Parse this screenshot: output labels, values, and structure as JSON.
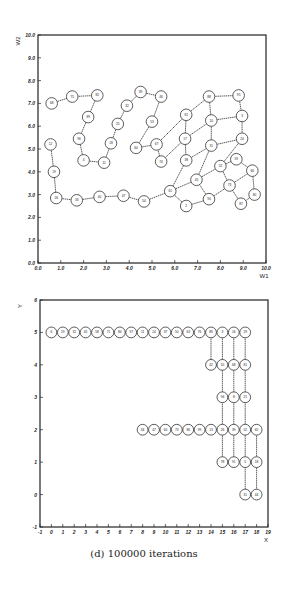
{
  "caption": "(d) 100000 iterations",
  "chart_data": [
    {
      "type": "scatter",
      "title": "",
      "xlabel": "W1",
      "ylabel": "W2",
      "xlim": [
        0,
        10
      ],
      "ylim": [
        0,
        10
      ],
      "xticks": [
        "0.0",
        "1.0",
        "2.0",
        "3.0",
        "4.0",
        "5.0",
        "6.0",
        "7.0",
        "8.0",
        "9.0",
        "10.0"
      ],
      "yticks": [
        "0.0",
        "1.0",
        "2.0",
        "3.0",
        "4.0",
        "5.0",
        "6.0",
        "7.0",
        "8.0",
        "9.0",
        "10.0"
      ],
      "nodes": [
        {
          "id": "a1",
          "x": 0.55,
          "y": 5.2
        },
        {
          "id": "a2",
          "x": 0.7,
          "y": 4.0
        },
        {
          "id": "a3",
          "x": 0.8,
          "y": 2.85
        },
        {
          "id": "a4",
          "x": 1.7,
          "y": 2.75
        },
        {
          "id": "a5",
          "x": 2.7,
          "y": 2.9
        },
        {
          "id": "a6",
          "x": 3.75,
          "y": 2.95
        },
        {
          "id": "a7",
          "x": 4.65,
          "y": 2.7
        },
        {
          "id": "a8",
          "x": 5.8,
          "y": 3.15
        },
        {
          "id": "b1",
          "x": 0.6,
          "y": 7.0
        },
        {
          "id": "b2",
          "x": 1.5,
          "y": 7.3
        },
        {
          "id": "b3",
          "x": 2.6,
          "y": 7.35
        },
        {
          "id": "b4",
          "x": 2.2,
          "y": 6.4
        },
        {
          "id": "b5",
          "x": 1.8,
          "y": 5.45
        },
        {
          "id": "b6",
          "x": 2.0,
          "y": 4.5
        },
        {
          "id": "b7",
          "x": 2.9,
          "y": 4.4
        },
        {
          "id": "b8",
          "x": 3.2,
          "y": 5.25
        },
        {
          "id": "b9",
          "x": 3.5,
          "y": 6.1
        },
        {
          "id": "b10",
          "x": 3.9,
          "y": 6.9
        },
        {
          "id": "b11",
          "x": 4.5,
          "y": 7.5
        },
        {
          "id": "b12",
          "x": 5.4,
          "y": 7.3
        },
        {
          "id": "b13",
          "x": 5.0,
          "y": 6.2
        },
        {
          "id": "b14",
          "x": 4.3,
          "y": 5.05
        },
        {
          "id": "b15",
          "x": 5.2,
          "y": 5.2
        },
        {
          "id": "b16",
          "x": 5.4,
          "y": 4.45
        },
        {
          "id": "c1",
          "x": 6.5,
          "y": 6.5
        },
        {
          "id": "c2",
          "x": 7.5,
          "y": 7.3
        },
        {
          "id": "c3",
          "x": 8.8,
          "y": 7.35
        },
        {
          "id": "c4",
          "x": 8.95,
          "y": 6.45
        },
        {
          "id": "c5",
          "x": 7.6,
          "y": 6.25
        },
        {
          "id": "c6",
          "x": 6.45,
          "y": 5.45
        },
        {
          "id": "c7",
          "x": 8.95,
          "y": 5.45
        },
        {
          "id": "c8",
          "x": 7.6,
          "y": 5.15
        },
        {
          "id": "c9",
          "x": 6.5,
          "y": 4.5
        },
        {
          "id": "c10",
          "x": 6.95,
          "y": 3.65
        },
        {
          "id": "c11",
          "x": 8.0,
          "y": 4.25
        },
        {
          "id": "c12",
          "x": 8.7,
          "y": 4.55
        },
        {
          "id": "c13",
          "x": 9.4,
          "y": 4.05
        },
        {
          "id": "c14",
          "x": 8.4,
          "y": 3.4
        },
        {
          "id": "c15",
          "x": 9.5,
          "y": 3.0
        },
        {
          "id": "c16",
          "x": 8.9,
          "y": 2.6
        },
        {
          "id": "c17",
          "x": 7.5,
          "y": 2.8
        },
        {
          "id": "c18",
          "x": 6.5,
          "y": 2.5
        }
      ],
      "edges": [
        [
          "a1",
          "a2"
        ],
        [
          "a2",
          "a3"
        ],
        [
          "a3",
          "a4"
        ],
        [
          "a4",
          "a5"
        ],
        [
          "a5",
          "a6"
        ],
        [
          "a6",
          "a7"
        ],
        [
          "a7",
          "a8"
        ],
        [
          "b1",
          "b2"
        ],
        [
          "b2",
          "b3"
        ],
        [
          "b3",
          "b4"
        ],
        [
          "b4",
          "b5"
        ],
        [
          "b5",
          "b6"
        ],
        [
          "b6",
          "b7"
        ],
        [
          "b7",
          "b8"
        ],
        [
          "b8",
          "b9"
        ],
        [
          "b9",
          "b10"
        ],
        [
          "b10",
          "b11"
        ],
        [
          "b11",
          "b12"
        ],
        [
          "b12",
          "b13"
        ],
        [
          "b13",
          "b14"
        ],
        [
          "b14",
          "b15"
        ],
        [
          "b15",
          "b16"
        ],
        [
          "b16",
          "c6"
        ],
        [
          "b15",
          "c1"
        ],
        [
          "c1",
          "c2"
        ],
        [
          "c2",
          "c3"
        ],
        [
          "c3",
          "c4"
        ],
        [
          "c4",
          "c7"
        ],
        [
          "c2",
          "c5"
        ],
        [
          "c5",
          "c4"
        ],
        [
          "c1",
          "c6"
        ],
        [
          "c6",
          "c5"
        ],
        [
          "c6",
          "c9"
        ],
        [
          "c5",
          "c8"
        ],
        [
          "c8",
          "c7"
        ],
        [
          "c9",
          "c8"
        ],
        [
          "c9",
          "a8"
        ],
        [
          "c8",
          "c10"
        ],
        [
          "c7",
          "c11"
        ],
        [
          "c11",
          "c12"
        ],
        [
          "c12",
          "c13"
        ],
        [
          "c13",
          "c15"
        ],
        [
          "c15",
          "c16"
        ],
        [
          "c16",
          "c14"
        ],
        [
          "c14",
          "c13"
        ],
        [
          "c11",
          "c14"
        ],
        [
          "c14",
          "c17"
        ],
        [
          "c17",
          "c10"
        ],
        [
          "c10",
          "c11"
        ],
        [
          "c10",
          "a8"
        ],
        [
          "a8",
          "c18"
        ],
        [
          "c18",
          "c17"
        ]
      ]
    },
    {
      "type": "scatter",
      "title": "",
      "xlabel": "X",
      "ylabel": "Y",
      "xlim": [
        -1,
        19
      ],
      "ylim": [
        -1,
        6
      ],
      "xticks": [
        "-1",
        "0",
        "1",
        "2",
        "3",
        "4",
        "5",
        "6",
        "7",
        "8",
        "9",
        "10",
        "11",
        "12",
        "13",
        "14",
        "15",
        "16",
        "17",
        "18",
        "19"
      ],
      "yticks": [
        "-1",
        "0",
        "1",
        "2",
        "3",
        "4",
        "5",
        "6"
      ],
      "nodes": [
        {
          "x": 0,
          "y": 5
        },
        {
          "x": 1,
          "y": 5
        },
        {
          "x": 2,
          "y": 5
        },
        {
          "x": 3,
          "y": 5
        },
        {
          "x": 4,
          "y": 5
        },
        {
          "x": 5,
          "y": 5
        },
        {
          "x": 6,
          "y": 5
        },
        {
          "x": 7,
          "y": 5
        },
        {
          "x": 8,
          "y": 5
        },
        {
          "x": 9,
          "y": 5
        },
        {
          "x": 10,
          "y": 5
        },
        {
          "x": 11,
          "y": 5
        },
        {
          "x": 12,
          "y": 5
        },
        {
          "x": 13,
          "y": 5
        },
        {
          "x": 14,
          "y": 5
        },
        {
          "x": 15,
          "y": 5
        },
        {
          "x": 16,
          "y": 5
        },
        {
          "x": 17,
          "y": 5
        },
        {
          "x": 14,
          "y": 4
        },
        {
          "x": 15,
          "y": 4
        },
        {
          "x": 16,
          "y": 4
        },
        {
          "x": 17,
          "y": 4
        },
        {
          "x": 15,
          "y": 3
        },
        {
          "x": 16,
          "y": 3
        },
        {
          "x": 17,
          "y": 3
        },
        {
          "x": 8,
          "y": 2
        },
        {
          "x": 9,
          "y": 2
        },
        {
          "x": 10,
          "y": 2
        },
        {
          "x": 11,
          "y": 2
        },
        {
          "x": 12,
          "y": 2
        },
        {
          "x": 13,
          "y": 2
        },
        {
          "x": 14,
          "y": 2
        },
        {
          "x": 15,
          "y": 2
        },
        {
          "x": 16,
          "y": 2
        },
        {
          "x": 17,
          "y": 2
        },
        {
          "x": 18,
          "y": 2
        },
        {
          "x": 15,
          "y": 1
        },
        {
          "x": 16,
          "y": 1
        },
        {
          "x": 17,
          "y": 1
        },
        {
          "x": 18,
          "y": 1
        },
        {
          "x": 17,
          "y": 0
        },
        {
          "x": 18,
          "y": 0
        }
      ],
      "edges": [
        [
          [
            0,
            5
          ],
          [
            17,
            5
          ]
        ],
        [
          [
            14,
            5
          ],
          [
            14,
            4
          ]
        ],
        [
          [
            14,
            4
          ],
          [
            17,
            4
          ]
        ],
        [
          [
            15,
            5
          ],
          [
            15,
            1
          ]
        ],
        [
          [
            16,
            5
          ],
          [
            16,
            1
          ]
        ],
        [
          [
            17,
            5
          ],
          [
            17,
            0
          ]
        ],
        [
          [
            15,
            3
          ],
          [
            17,
            3
          ]
        ],
        [
          [
            8,
            2
          ],
          [
            18,
            2
          ]
        ],
        [
          [
            18,
            2
          ],
          [
            18,
            0
          ]
        ],
        [
          [
            15,
            1
          ],
          [
            18,
            1
          ]
        ],
        [
          [
            17,
            0
          ],
          [
            18,
            0
          ]
        ]
      ]
    }
  ]
}
